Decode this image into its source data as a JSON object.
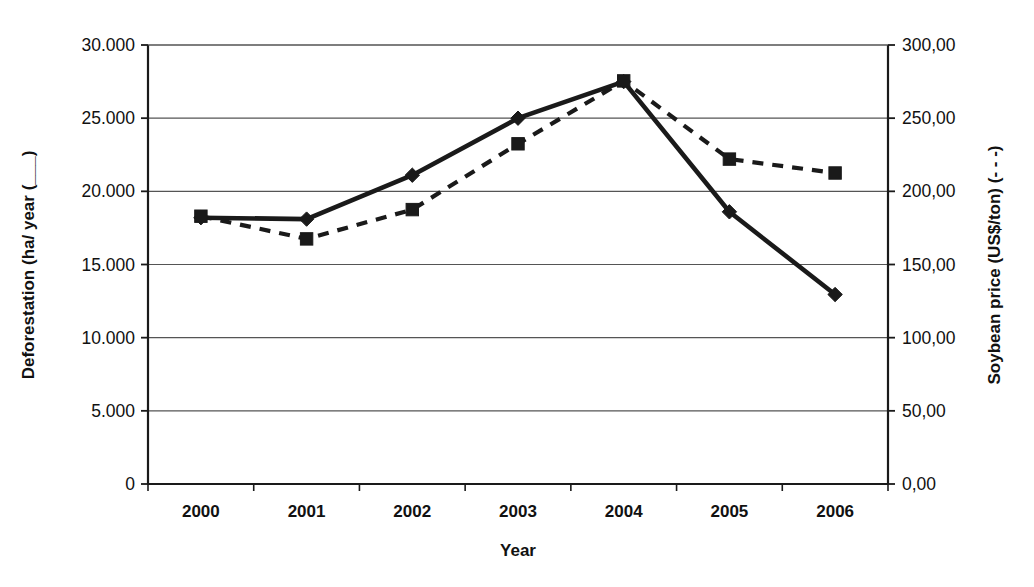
{
  "chart_data": {
    "type": "line",
    "title": "",
    "xlabel": "Year",
    "categories": [
      "2000",
      "2001",
      "2002",
      "2003",
      "2004",
      "2005",
      "2006"
    ],
    "grid": true,
    "legend": "inline-in-axis-titles",
    "axes": {
      "left": {
        "label": "Deforestation (ha/ year (___)",
        "label_text": "Deforestation (ha/ year (",
        "label_marker": "___",
        "label_close": ")",
        "ticks": [
          "0",
          "5.000",
          "10.000",
          "15.000",
          "20.000",
          "25.000",
          "30.000"
        ],
        "tick_values": [
          0,
          5000,
          10000,
          15000,
          20000,
          25000,
          30000
        ],
        "ylim": [
          0,
          30000
        ]
      },
      "right": {
        "label": "Soybean price (US$/ton) (- - -)",
        "label_text": "Soybean price (US$/ton) (",
        "label_marker": "- - -",
        "label_close": ")",
        "ticks": [
          "0,00",
          "50,00",
          "100,00",
          "150,00",
          "200,00",
          "250,00",
          "300,00"
        ],
        "tick_values": [
          0,
          50,
          100,
          150,
          200,
          250,
          300
        ],
        "ylim": [
          0,
          300
        ]
      }
    },
    "series": [
      {
        "name": "Deforestation (ha/ year)",
        "axis": "left",
        "style": "solid",
        "marker": "diamond",
        "color": "#1a1a1a",
        "values": [
          18200,
          18100,
          21100,
          25000,
          27500,
          18600,
          12950
        ]
      },
      {
        "name": "Soybean price (US$/ton)",
        "axis": "right",
        "style": "dashed",
        "marker": "square",
        "color": "#1a1a1a",
        "values": [
          183.0,
          167.5,
          187.5,
          232.5,
          275.5,
          222.0,
          212.5
        ]
      }
    ]
  },
  "plot_geometry": {
    "left": 148,
    "right": 888,
    "top": 45,
    "bottom": 484
  }
}
